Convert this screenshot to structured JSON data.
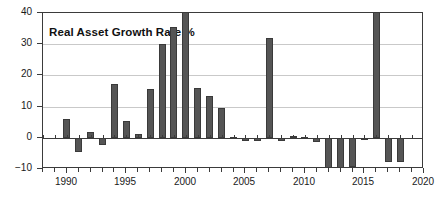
{
  "chart_data": {
    "type": "bar",
    "title": "Real Asset Growth Rate %",
    "xlabel": "",
    "ylabel": "",
    "xlim": [
      1988,
      2020
    ],
    "ylim": [
      -10,
      40
    ],
    "ytick_labels": [
      "40",
      "30",
      "20",
      "10",
      "0",
      "-10"
    ],
    "ytick_values": [
      40,
      30,
      20,
      10,
      0,
      -10
    ],
    "xtick_labels": [
      "1990",
      "1995",
      "2000",
      "2005",
      "2010",
      "2015",
      "2020"
    ],
    "xtick_values": [
      1990,
      1995,
      2000,
      2005,
      2010,
      2015,
      2020
    ],
    "grid": "horizontal",
    "legend": "none",
    "bar_color": "#555555",
    "categories": [
      1988,
      1989,
      1990,
      1991,
      1992,
      1993,
      1994,
      1995,
      1996,
      1997,
      1998,
      1999,
      2000,
      2001,
      2002,
      2003,
      2004,
      2005,
      2006,
      2007,
      2008,
      2009,
      2010,
      2011,
      2012,
      2013,
      2014,
      2015,
      2016,
      2017,
      2018,
      2019,
      2020
    ],
    "values": [
      0,
      0,
      6.0,
      -4.6,
      1.8,
      -2.2,
      17.2,
      5.5,
      1.2,
      15.5,
      30.2,
      35.6,
      44.0,
      16.0,
      13.3,
      9.5,
      0.4,
      -1.1,
      -1.1,
      32.0,
      -1.0,
      0.5,
      0.4,
      -1.2,
      -10.0,
      -9.8,
      -9.3,
      -0.4,
      46.0,
      -7.8,
      -7.7,
      0,
      0
    ],
    "clipped_at_top": [
      2000,
      2016
    ]
  }
}
